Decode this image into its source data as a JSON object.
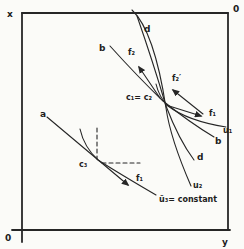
{
  "figure": {
    "ink_color": "#262626",
    "background_color": "#fbfbf8",
    "axes": {
      "x_label": "x",
      "y_label": "y",
      "origin_bottom_left": "0",
      "origin_top_right": "0"
    },
    "point_labels": {
      "intersection": "c₁= c₂",
      "tangency": "c₃",
      "constant_curve": "ū₃= constant"
    },
    "strokes": [
      {
        "name": "axis-left",
        "d": "M22,13 L22,242",
        "w": 1.8
      },
      {
        "name": "axis-bottom",
        "d": "M12,230 L230,230",
        "w": 1.8
      },
      {
        "name": "border-top",
        "d": "M22,13 L228,13",
        "w": 1.8
      },
      {
        "name": "border-right",
        "d": "M228,13 L228,230",
        "w": 1.8
      },
      {
        "name": "curve-u2",
        "d": "M132,10 C149,26 159,62 166,108 C170,136 181,163 191,186",
        "w": 1.1
      },
      {
        "name": "curve-d",
        "d": "M137,16 Q153,62 166,106 Q179,140 194,160",
        "w": 1.1
      },
      {
        "name": "curve-b",
        "d": "M110,46 Q138,77 163,101 Q189,122 214,137",
        "w": 1.1
      },
      {
        "name": "curve-u1",
        "d": "M156,84 Q159,97 168,106 Q188,121 226,127",
        "w": 1.1
      },
      {
        "name": "vector-f1-upper",
        "d": "M166,105 L201,116",
        "w": 1.1,
        "arrow": true
      },
      {
        "name": "vector-f2-prime",
        "d": "M203,114 L173,90",
        "w": 1.1,
        "arrow": true
      },
      {
        "name": "vector-f2",
        "d": "M160,98 L139,67",
        "w": 1.1,
        "arrow": true
      },
      {
        "name": "line-a",
        "d": "M47,117 L128,185",
        "w": 1.1,
        "arrow": true
      },
      {
        "name": "curve-u3",
        "d": "M80,129 Q84,147 98,160 Q120,174 156,195",
        "w": 1.1
      },
      {
        "name": "dash-vertical",
        "d": "M97,128 L97,159",
        "w": 1.1,
        "dashed": true
      },
      {
        "name": "dash-horizontal",
        "d": "M102,163 L140,163",
        "w": 1.1,
        "dashed": true
      }
    ],
    "labels": [
      {
        "name": "label-x-axis",
        "text": "x",
        "x": 7,
        "y": 17,
        "size": 9
      },
      {
        "name": "label-origin-top",
        "text": "0",
        "x": 233,
        "y": 12,
        "size": 9
      },
      {
        "name": "label-origin-bottom",
        "text": "0",
        "x": 5,
        "y": 241,
        "size": 9
      },
      {
        "name": "label-y-axis",
        "text": "y",
        "x": 222,
        "y": 245,
        "size": 9
      },
      {
        "name": "label-a",
        "text": "a",
        "x": 40,
        "y": 117,
        "size": 9
      },
      {
        "name": "label-b-top",
        "text": "b",
        "x": 99,
        "y": 51,
        "size": 9
      },
      {
        "name": "label-d-top",
        "text": "d",
        "x": 144,
        "y": 32,
        "size": 9
      },
      {
        "name": "label-f2",
        "text": "f₂",
        "x": 128,
        "y": 55,
        "size": 8
      },
      {
        "name": "label-c1-c2",
        "text": "c₁= c₂",
        "x": 126,
        "y": 100,
        "size": 8
      },
      {
        "name": "label-f2-prime",
        "text": "f₂′",
        "x": 172,
        "y": 81,
        "size": 8
      },
      {
        "name": "label-f1-upper",
        "text": "f₁",
        "x": 209,
        "y": 116,
        "size": 8
      },
      {
        "name": "label-u1",
        "text": "u₁",
        "x": 223,
        "y": 133,
        "size": 8
      },
      {
        "name": "label-b-right",
        "text": "b",
        "x": 215,
        "y": 144,
        "size": 9
      },
      {
        "name": "label-d-right",
        "text": "d",
        "x": 197,
        "y": 160,
        "size": 9
      },
      {
        "name": "label-u2",
        "text": "u₂",
        "x": 193,
        "y": 188,
        "size": 8
      },
      {
        "name": "label-u3-constant",
        "text": "ū₃= constant",
        "x": 159,
        "y": 202,
        "size": 8
      },
      {
        "name": "label-c3",
        "text": "c₃",
        "x": 79,
        "y": 167,
        "size": 8
      },
      {
        "name": "label-f1-lower",
        "text": "f₁",
        "x": 136,
        "y": 181,
        "size": 8
      }
    ]
  }
}
